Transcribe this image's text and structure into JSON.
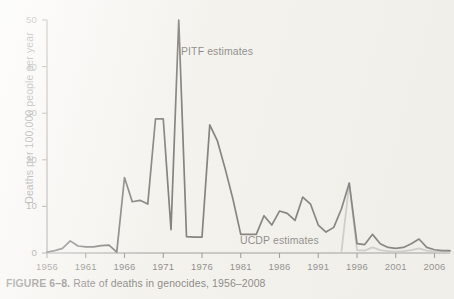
{
  "figure": {
    "caption_prefix": "FIGURE 6–8.",
    "caption_text": "Rate of deaths in genocides, 1956–2008"
  },
  "labels": {
    "pitf": "PITF estimates",
    "ucdp": "UCDP estimates"
  },
  "colors": {
    "pitf_line": "#121212",
    "ucdp_line": "#a9a9a9",
    "axis": "#4a4a4a",
    "background": "#f3f1ec",
    "text": "#1a1a1a"
  },
  "chart_data": {
    "type": "line",
    "title": "Rate of deaths in genocides, 1956–2008",
    "xlabel": "",
    "ylabel": "Deaths per 100,000 people per year",
    "xlim": [
      1956,
      2008
    ],
    "ylim": [
      0,
      50
    ],
    "yticks": [
      0,
      10,
      20,
      30,
      40,
      50
    ],
    "ytick_labels": [
      "0",
      "10",
      "20",
      "30",
      "40",
      "50"
    ],
    "xticks": [
      1956,
      1961,
      1966,
      1971,
      1976,
      1981,
      1986,
      1991,
      1996,
      2001,
      2006
    ],
    "xtick_labels": [
      "1956",
      "1961",
      "1966",
      "1971",
      "1976",
      "1981",
      "1986",
      "1991",
      "1996",
      "2001",
      "2006"
    ],
    "grid": false,
    "legend_position": "inline-annotation",
    "series": [
      {
        "name": "PITF estimates",
        "color": "#121212",
        "x": [
          1956,
          1957,
          1958,
          1959,
          1960,
          1961,
          1962,
          1963,
          1964,
          1965,
          1966,
          1967,
          1968,
          1969,
          1970,
          1971,
          1972,
          1973,
          1974,
          1975,
          1976,
          1977,
          1978,
          1979,
          1980,
          1981,
          1982,
          1983,
          1984,
          1985,
          1986,
          1987,
          1988,
          1989,
          1990,
          1991,
          1992,
          1993,
          1994,
          1995,
          1996,
          1997,
          1998,
          1999,
          2000,
          2001,
          2002,
          2003,
          2004,
          2005,
          2006,
          2007,
          2008
        ],
        "values": [
          0.2,
          0.5,
          1.0,
          2.6,
          1.5,
          1.3,
          1.3,
          1.6,
          1.7,
          0.2,
          16.2,
          11.0,
          11.3,
          10.5,
          28.8,
          28.8,
          5.0,
          50.0,
          3.5,
          3.4,
          3.4,
          27.5,
          24.0,
          18.0,
          11.5,
          4.0,
          4.0,
          4.0,
          8.0,
          6.0,
          9.0,
          8.5,
          7.0,
          12.0,
          10.5,
          6.0,
          4.5,
          5.5,
          9.5,
          15.0,
          2.0,
          1.8,
          4.0,
          2.0,
          1.2,
          1.0,
          1.2,
          2.0,
          3.0,
          1.2,
          0.7,
          0.5,
          0.5
        ]
      },
      {
        "name": "UCDP estimates",
        "color": "#a9a9a9",
        "x": [
          1994,
          1995,
          1996,
          1997,
          1998,
          1999,
          2000,
          2001,
          2002,
          2003,
          2004,
          2005,
          2006,
          2007,
          2008
        ],
        "values": [
          0.4,
          15.0,
          0.6,
          0.5,
          1.2,
          0.6,
          0.4,
          0.3,
          0.4,
          0.6,
          1.0,
          0.5,
          0.3,
          0.3,
          0.3
        ]
      }
    ]
  }
}
